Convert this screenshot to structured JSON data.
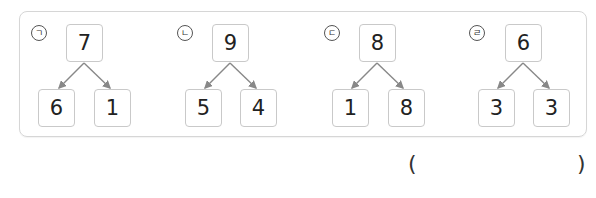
{
  "problem": {
    "items": [
      {
        "label": "ㄱ",
        "total": "7",
        "parts": [
          "6",
          "1"
        ]
      },
      {
        "label": "ㄴ",
        "total": "9",
        "parts": [
          "5",
          "4"
        ]
      },
      {
        "label": "ㄷ",
        "total": "8",
        "parts": [
          "1",
          "8"
        ]
      },
      {
        "label": "ㄹ",
        "total": "6",
        "parts": [
          "3",
          "3"
        ]
      }
    ],
    "answer": {
      "open_paren": "(",
      "value": "",
      "close_paren": ")"
    }
  },
  "colors": {
    "frame_border": "#d6d6d6",
    "box_border": "#c9c9c9",
    "arrow": "#888888"
  }
}
